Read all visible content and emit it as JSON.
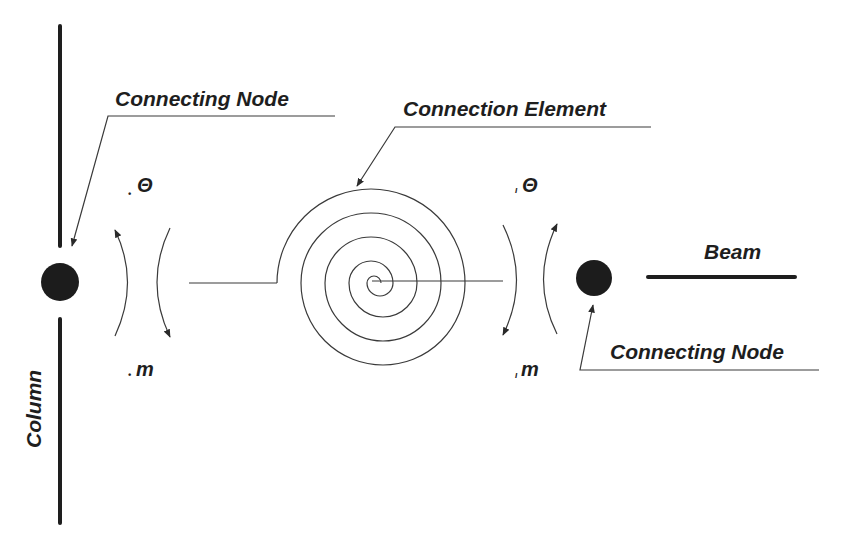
{
  "diagram": {
    "labels": {
      "connecting_node_left": "Connecting Node",
      "connection_element": "Connection Element",
      "connecting_node_right": "Connecting Node",
      "beam": "Beam",
      "column": "Column"
    },
    "symbols": {
      "left_theta": "Θ",
      "left_theta_sub": "•",
      "left_moment": "m",
      "left_moment_sub": "•",
      "right_theta": "Θ",
      "right_theta_sub": "ı",
      "right_moment": "m",
      "right_moment_sub": "ı"
    },
    "colors": {
      "ink": "#1e1e1e",
      "line": "#3a3a3a",
      "background": "#ffffff"
    },
    "elements": {
      "column": {
        "x": 60,
        "top_segment": [
          25,
          247
        ],
        "bottom_segment": [
          318,
          524
        ]
      },
      "left_node": {
        "cx": 60,
        "cy": 282,
        "r": 19
      },
      "right_node": {
        "cx": 594,
        "cy": 278,
        "r": 18
      },
      "beam": {
        "y": 277,
        "x1": 647,
        "x2": 796
      },
      "spiral": {
        "cx": 370,
        "cy": 283,
        "turns": 3.5
      }
    }
  }
}
